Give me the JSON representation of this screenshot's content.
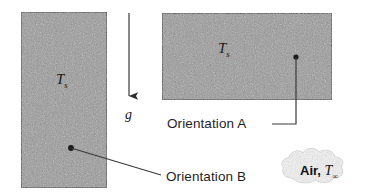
{
  "figure": {
    "background_color": "#ffffff",
    "plate_fill_color": "#9a9a9a",
    "plate_border_color": "#3a3a3a",
    "line_color": "#333333",
    "text_color": "#1f1f1f"
  },
  "plates": [
    {
      "id": "vertical-plate",
      "orientation_name": "Orientation B",
      "surface_temp_symbol": "T",
      "surface_temp_subscript": "s",
      "x": 21,
      "y": 12,
      "width": 86,
      "height": 176
    },
    {
      "id": "horizontal-plate",
      "orientation_name": "Orientation A",
      "surface_temp_symbol": "T",
      "surface_temp_subscript": "s",
      "x": 162,
      "y": 13,
      "width": 170,
      "height": 87
    }
  ],
  "gravity": {
    "label": "g",
    "arrow_direction": "down",
    "x": 129,
    "y_start": 13,
    "y_end": 103
  },
  "callouts": [
    {
      "id": "orientation-a",
      "label": "Orientation A",
      "x": 167,
      "y": 117
    },
    {
      "id": "orientation-b",
      "label": "Orientation B",
      "x": 166,
      "y": 170
    }
  ],
  "ambient": {
    "fluid": "Air,",
    "temp_symbol": "T",
    "temp_subscript": "∞",
    "x": 300,
    "y": 163
  }
}
